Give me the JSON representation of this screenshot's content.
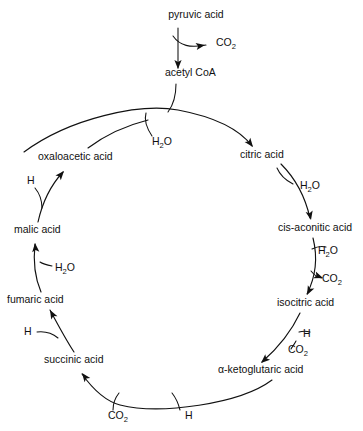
{
  "diagram": {
    "type": "cyclic-pathway-diagram",
    "background_color": "#ffffff",
    "stroke_color": "#111111",
    "text_color": "#111111",
    "entry": {
      "start_label": "pyruvic acid",
      "start_x": 196,
      "start_y": 18,
      "released_label": "CO2",
      "released_display": "CO",
      "released_sub": "2",
      "released_x": 216,
      "released_y": 46,
      "product_label": "acetyl CoA",
      "product_x": 165,
      "product_y": 76
    },
    "cycle_nodes": [
      {
        "id": "citric",
        "label": "citric acid",
        "x": 240,
        "y": 158,
        "anchor": "start"
      },
      {
        "id": "cis-aconitic",
        "label": "cis-aconitic acid",
        "x": 278,
        "y": 231,
        "anchor": "start"
      },
      {
        "id": "isocitric",
        "label": "isocitric acid",
        "x": 277,
        "y": 306,
        "anchor": "start"
      },
      {
        "id": "alpha-ketoglutaric",
        "label": "α-ketoglutaric acid",
        "x": 218,
        "y": 373,
        "anchor": "start"
      },
      {
        "id": "succinic",
        "label": "succinic acid",
        "x": 44,
        "y": 363,
        "anchor": "start"
      },
      {
        "id": "fumaric",
        "label": "fumaric acid",
        "x": 7,
        "y": 303,
        "anchor": "start"
      },
      {
        "id": "malic",
        "label": "malic acid",
        "x": 14,
        "y": 233,
        "anchor": "start"
      },
      {
        "id": "oxaloacetic",
        "label": "oxaloacetic acid",
        "x": 38,
        "y": 160,
        "anchor": "start"
      }
    ],
    "side_labels": [
      {
        "id": "water-acetyl-citric",
        "text": "H2O",
        "display": "H",
        "sub": "2",
        "tail": "O",
        "x": 152,
        "y": 145
      },
      {
        "id": "water-citric-cisaconitic",
        "text": "H2O",
        "display": "H",
        "sub": "2",
        "tail": "O",
        "x": 300,
        "y": 189
      },
      {
        "id": "water-cisaconitic-isocitric",
        "text": "H2O",
        "display": "H",
        "sub": "2",
        "tail": "O",
        "x": 318,
        "y": 254
      },
      {
        "id": "co2-cisaconitic-isocitric",
        "text": "CO2",
        "display": "CO",
        "sub": "2",
        "tail": "",
        "x": 322,
        "y": 282
      },
      {
        "id": "hydrogen-isocitric-ketoglutaric",
        "text": "H",
        "display": "H",
        "sub": "",
        "tail": "",
        "x": 303,
        "y": 337
      },
      {
        "id": "co2-isocitric-ketoglutaric",
        "text": "CO2",
        "display": "CO",
        "sub": "2",
        "tail": "",
        "x": 288,
        "y": 353
      },
      {
        "id": "hydrogen-ketoglutaric-succinic",
        "text": "H",
        "display": "H",
        "sub": "",
        "tail": "",
        "x": 185,
        "y": 419
      },
      {
        "id": "co2-ketoglutaric-succinic",
        "text": "CO2",
        "display": "CO",
        "sub": "2",
        "tail": "",
        "x": 108,
        "y": 419
      },
      {
        "id": "hydrogen-succinic-fumaric",
        "text": "H",
        "display": "H",
        "sub": "",
        "tail": "",
        "x": 24,
        "y": 335
      },
      {
        "id": "water-fumaric-malic",
        "text": "H2O",
        "display": "H",
        "sub": "2",
        "tail": "O",
        "x": 55,
        "y": 271
      },
      {
        "id": "hydrogen-malic-oxaloacetic",
        "text": "H",
        "display": "H",
        "sub": "",
        "tail": "",
        "x": 27,
        "y": 184
      }
    ],
    "arc_segments": [
      {
        "id": "arc-acetyl-to-citric",
        "from": "acetyl CoA",
        "to": "citric acid",
        "d": "M 24,152 C 70,118 140,103 178,110 C 215,117 240,130 252,146"
      },
      {
        "id": "arc-citric-to-cisaconitic",
        "from": "citric acid",
        "to": "cis-aconitic acid",
        "d": "M 281,164 C 295,178 305,196 310,218"
      },
      {
        "id": "arc-cisaconitic-to-isocitric",
        "from": "cis-aconitic acid",
        "to": "isocitric acid",
        "d": "M 313,238 C 318,258 315,278 307,294"
      },
      {
        "id": "arc-isocitric-to-ketoglutaric",
        "from": "isocitric acid",
        "to": "α-ketoglutaric acid",
        "d": "M 300,313 C 292,330 278,348 262,362"
      },
      {
        "id": "arc-ketoglutaric-to-succinic",
        "from": "α-ketoglutaric acid",
        "to": "succinic acid",
        "d": "M 272,380 C 240,404 160,415 120,405 C 105,401 92,388 82,374"
      },
      {
        "id": "arc-succinic-to-fumaric",
        "from": "succinic acid",
        "to": "fumaric acid",
        "d": "M 74,352 C 66,340 58,325 50,310"
      },
      {
        "id": "arc-fumaric-to-malic",
        "from": "fumaric acid",
        "to": "malic acid",
        "d": "M 41,292 C 35,278 33,262 35,244"
      },
      {
        "id": "arc-malic-to-oxaloacetic",
        "from": "malic acid",
        "to": "oxaloacetic acid",
        "d": "M 38,222 C 42,204 50,186 63,172"
      },
      {
        "id": "arc-oxaloacetic-to-top",
        "from": "oxaloacetic acid",
        "to": "cycle top",
        "d": "M 88,148 C 104,136 124,126 148,120"
      }
    ],
    "branch_segments": [
      {
        "id": "branch-pyruvic-down",
        "d": "M 178,28 L 178,68"
      },
      {
        "id": "branch-pyruvic-co2",
        "d": "M 173,36 C 180,46 190,48 206,45"
      },
      {
        "id": "branch-acetyl-down",
        "d": "M 176,84 C 176,96 174,104 168,112"
      },
      {
        "id": "branch-water-in-citric",
        "d": "M 152,136 C 146,127 144,120 146,113"
      },
      {
        "id": "branch-water-out-citric",
        "d": "M 293,184 C 285,180 280,175 277,168"
      },
      {
        "id": "branch-water-in-isocitric",
        "d": "M 312,249 C 318,246 322,246 326,247"
      },
      {
        "id": "branch-co2-out-isocitric",
        "d": "M 311,271 C 315,276 318,278 322,278"
      },
      {
        "id": "branch-h-in-ketoglutaric",
        "d": "M 299,332 C 303,331 306,331 310,332"
      },
      {
        "id": "branch-co2-out-ketoglutaric",
        "d": "M 296,341 C 294,345 292,347 291,349"
      },
      {
        "id": "branch-h-in-succinic",
        "d": "M 180,410 C 178,402 176,398 172,393"
      },
      {
        "id": "branch-co2-out-succinic",
        "d": "M 113,410 C 113,402 115,398 119,393"
      },
      {
        "id": "branch-h-in-fumaric",
        "d": "M 37,332 C 45,331 52,333 58,338"
      },
      {
        "id": "branch-water-out-fumaric",
        "d": "M 52,266 C 47,265 43,264 40,262"
      },
      {
        "id": "branch-h-in-oxaloacetic",
        "d": "M 35,188 C 40,194 42,200 42,208"
      }
    ],
    "arrowheads": [
      {
        "id": "arrowhead-to-co2-top",
        "x": 205,
        "y": 45,
        "angle": -10
      },
      {
        "id": "arrowhead-to-acetyl-coa",
        "x": 178,
        "y": 69,
        "angle": 90
      },
      {
        "id": "arrowhead-to-citric",
        "x": 253,
        "y": 147,
        "angle": 52
      },
      {
        "id": "arrowhead-to-cisaconitic",
        "x": 311,
        "y": 220,
        "angle": 78
      },
      {
        "id": "arrowhead-to-isocitric",
        "x": 307,
        "y": 295,
        "angle": 117
      },
      {
        "id": "arrowhead-to-ketoglutaric",
        "x": 261,
        "y": 363,
        "angle": 138
      },
      {
        "id": "arrowhead-to-succinic",
        "x": 82,
        "y": 373,
        "angle": 233
      },
      {
        "id": "arrowhead-to-fumaric",
        "x": 50,
        "y": 310,
        "angle": 241
      },
      {
        "id": "arrowhead-to-malic",
        "x": 35,
        "y": 243,
        "angle": 265
      },
      {
        "id": "arrowhead-to-oxaloacetic",
        "x": 64,
        "y": 171,
        "angle": 311
      },
      {
        "id": "arrowhead-co2-out-cisaconitic",
        "x": 323,
        "y": 278,
        "angle": 20
      }
    ]
  }
}
